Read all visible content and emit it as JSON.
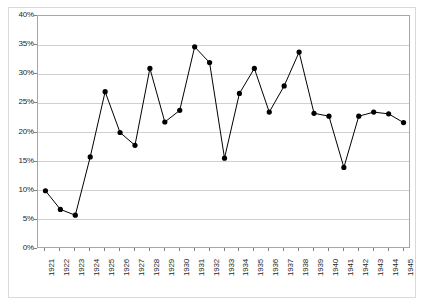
{
  "chart_data": {
    "type": "line",
    "title": "",
    "subtitle": "",
    "xlabel": "",
    "ylabel": "",
    "ylim": [
      0,
      40
    ],
    "ytick_labels": [
      "0%",
      "5%",
      "10%",
      "15%",
      "20%",
      "25%",
      "30%",
      "35%",
      "40%"
    ],
    "ytick_values": [
      0,
      5,
      10,
      15,
      20,
      25,
      30,
      35,
      40
    ],
    "grid": true,
    "legend": "none",
    "marker": "filled-circle",
    "line_color": "#000000",
    "marker_color": "#000000",
    "grid_color": "#d0d0d0",
    "plot_border_color": "#a6a6a6",
    "categories": [
      "1921",
      "1922",
      "1923",
      "1924",
      "1925",
      "1926",
      "1927",
      "1928",
      "1929",
      "1930",
      "1931",
      "1932",
      "1933",
      "1934",
      "1935",
      "1936",
      "1937",
      "1938",
      "1939",
      "1940",
      "1941",
      "1942",
      "1943",
      "1944",
      "1945"
    ],
    "values": [
      10.0,
      6.8,
      5.8,
      15.8,
      27.0,
      20.0,
      17.8,
      31.0,
      21.8,
      23.8,
      34.7,
      32.0,
      15.6,
      26.7,
      31.0,
      23.5,
      28.0,
      33.8,
      23.3,
      22.8,
      14.0,
      22.8,
      23.5,
      23.2,
      21.7
    ],
    "series": [
      {
        "name": "",
        "values": [
          10.0,
          6.8,
          5.8,
          15.8,
          27.0,
          20.0,
          17.8,
          31.0,
          21.8,
          23.8,
          34.7,
          32.0,
          15.6,
          26.7,
          31.0,
          23.5,
          28.0,
          33.8,
          23.3,
          22.8,
          14.0,
          22.8,
          23.5,
          23.2,
          21.7
        ]
      }
    ]
  }
}
